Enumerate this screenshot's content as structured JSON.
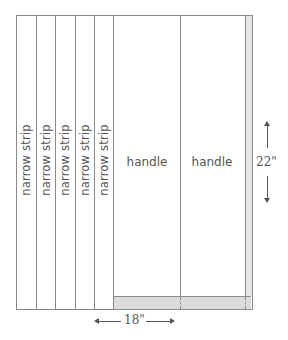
{
  "diagram": {
    "type": "fabric cutting layout",
    "colors": {
      "line": "#8a8a8a",
      "fill_trim": "#dcdcdc",
      "text": "#555555",
      "background": "#ffffff"
    },
    "narrow_strips": [
      {
        "label": "narrow strip"
      },
      {
        "label": "narrow strip"
      },
      {
        "label": "narrow strip"
      },
      {
        "label": "narrow strip"
      },
      {
        "label": "narrow strip"
      }
    ],
    "handles": [
      {
        "label": "handle"
      },
      {
        "label": "handle"
      }
    ],
    "dimensions": {
      "height": "22\"",
      "width": "18\""
    }
  }
}
